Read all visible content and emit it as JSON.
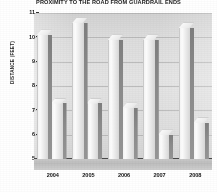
{
  "chart_data": {
    "type": "bar",
    "title": "PROXIMITY TO THE ROAD FROM GUARDRAIL ENDS",
    "xlabel": "",
    "ylabel": "DISTANCE (FEET)",
    "categories": [
      "2004",
      "2005",
      "2006",
      "2007",
      "2008"
    ],
    "series": [
      {
        "name": "Series 1",
        "values": [
          10.1,
          10.6,
          9.9,
          9.9,
          10.4
        ]
      },
      {
        "name": "Series 2",
        "values": [
          7.3,
          7.3,
          7.1,
          6.0,
          6.5
        ]
      }
    ],
    "ylim": [
      5,
      11
    ],
    "yticks": [
      "11",
      "10",
      "9",
      "8",
      "7",
      "6",
      "5"
    ],
    "grid": true,
    "legend": "none",
    "style": "3d-grayscale"
  },
  "axis": {
    "y_title": "DISTANCE (FEET)",
    "y_labels": [
      "11",
      "10",
      "9",
      "8",
      "7",
      "6",
      "5"
    ],
    "x_labels": [
      "2004",
      "2005",
      "2006",
      "2007",
      "2008"
    ]
  },
  "header": {
    "title": "PROXIMITY TO THE ROAD FROM GUARDRAIL ENDS"
  }
}
